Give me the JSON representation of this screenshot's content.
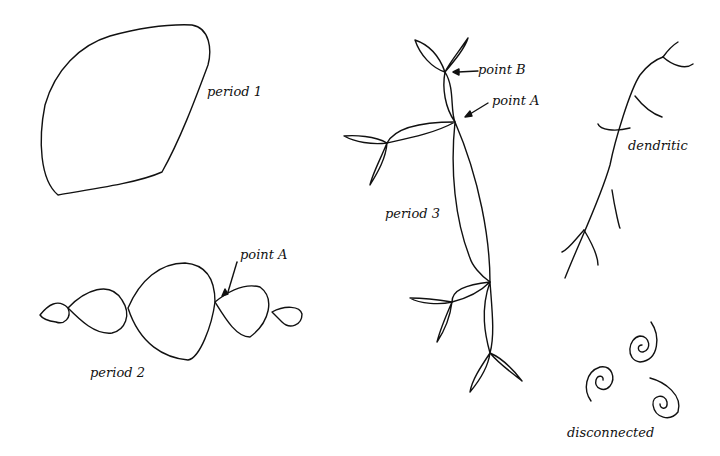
{
  "labels": {
    "period1": "period 1",
    "period2": "period 2",
    "period2_pointA": "point A",
    "period3": "period 3",
    "period3_pointA": "point A",
    "period3_pointB": "point B",
    "dendritic": "dendritic",
    "disconnected": "disconnected"
  },
  "colors": {
    "ink": "#111111",
    "background": "#ffffff"
  }
}
